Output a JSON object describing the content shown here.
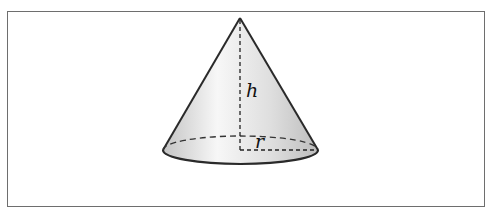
{
  "figure": {
    "labels": {
      "height": "h",
      "radius": "r"
    },
    "colors": {
      "outline": "#2a2a2a",
      "frame": "#6e6e6e",
      "fill_light": "#ffffff",
      "fill_dark": "#c8c8c8"
    }
  }
}
